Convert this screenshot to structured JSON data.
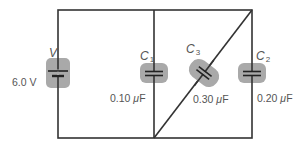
{
  "diagram": {
    "type": "circuit",
    "colors": {
      "wire": "#333333",
      "component_highlight": "#a9a9a9",
      "text": "#555555"
    },
    "components": [
      {
        "id": "V",
        "kind": "battery",
        "symbol": "V",
        "sub": "",
        "value": "6.0 V"
      },
      {
        "id": "C1",
        "kind": "capacitor",
        "symbol": "C",
        "sub": "1",
        "value_num": "0.10",
        "unit_prefix": "μ",
        "unit": "F"
      },
      {
        "id": "C3",
        "kind": "capacitor",
        "symbol": "C",
        "sub": "3",
        "value_num": "0.30",
        "unit_prefix": "μ",
        "unit": "F"
      },
      {
        "id": "C2",
        "kind": "capacitor",
        "symbol": "C",
        "sub": "2",
        "value_num": "0.20",
        "unit_prefix": "μ",
        "unit": "F"
      }
    ]
  }
}
